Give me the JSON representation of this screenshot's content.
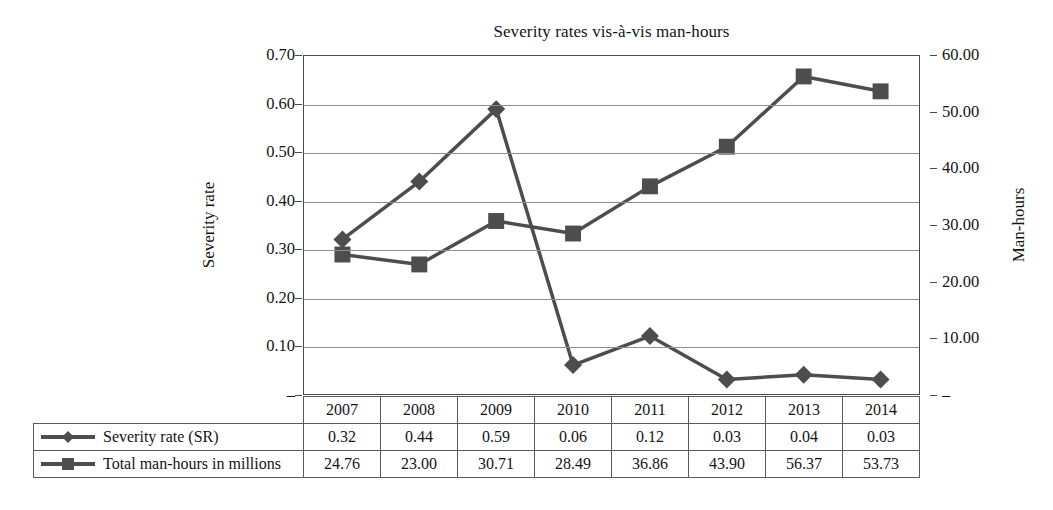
{
  "chart_data": {
    "type": "line",
    "title": "Severity rates vis-à-vis man-hours",
    "xlabel": "",
    "ylabel": "Severity rate",
    "y2label": "Man-hours",
    "categories": [
      "2007",
      "2008",
      "2009",
      "2010",
      "2011",
      "2012",
      "2013",
      "2014"
    ],
    "series": [
      {
        "name": "Severity rate (SR)",
        "axis": "left",
        "marker": "diamond",
        "color": "#4d4d4d",
        "values": [
          0.32,
          0.44,
          0.59,
          0.06,
          0.12,
          0.03,
          0.04,
          0.03
        ]
      },
      {
        "name": "Total man-hours in millions",
        "axis": "right",
        "marker": "square",
        "color": "#4d4d4d",
        "values": [
          24.76,
          23.0,
          30.71,
          28.49,
          36.86,
          43.9,
          56.37,
          53.73
        ]
      }
    ],
    "ylim": [
      0,
      0.7
    ],
    "y2lim": [
      0,
      60.0
    ],
    "yticks": [
      "–",
      "0.10",
      "0.20",
      "0.30",
      "0.40",
      "0.50",
      "0.60",
      "0.70"
    ],
    "ytick_values": [
      0,
      0.1,
      0.2,
      0.3,
      0.4,
      0.5,
      0.6,
      0.7
    ],
    "y2ticks": [
      "–",
      "10.00",
      "20.00",
      "30.00",
      "40.00",
      "50.00",
      "60.00"
    ],
    "y2tick_values": [
      0,
      10,
      20,
      30,
      40,
      50,
      60
    ],
    "grid": true,
    "legend_position": "data-table-below"
  },
  "table": {
    "row_labels": [
      "Severity rate (SR)",
      "Total man-hours in millions"
    ],
    "years": [
      "2007",
      "2008",
      "2009",
      "2010",
      "2011",
      "2012",
      "2013",
      "2014"
    ],
    "severity_values": [
      "0.32",
      "0.44",
      "0.59",
      "0.06",
      "0.12",
      "0.03",
      "0.04",
      "0.03"
    ],
    "manhours_values": [
      "24.76",
      "23.00",
      "30.71",
      "28.49",
      "36.86",
      "43.90",
      "56.37",
      "53.73"
    ]
  },
  "axes": {
    "left_ticks": [
      "0.70",
      "0.60",
      "0.50",
      "0.40",
      "0.30",
      "0.20",
      "0.10",
      "–"
    ],
    "right_ticks": [
      "60.00",
      "50.00",
      "40.00",
      "30.00",
      "20.00",
      "10.00",
      "–"
    ],
    "left_title": "Severity rate",
    "right_title": "Man-hours"
  },
  "colors": {
    "series": "#4d4d4d",
    "grid": "#8e8e8e",
    "axis": "#4a4a4a",
    "text": "#141414",
    "background": "#ffffff"
  }
}
